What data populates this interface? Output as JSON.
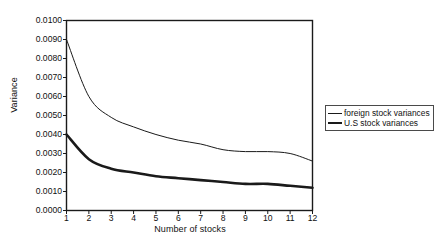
{
  "chart_data": {
    "type": "line",
    "title": "",
    "xlabel": "Number of stocks",
    "ylabel": "Variance",
    "xlim": [
      1,
      12
    ],
    "ylim": [
      0.0,
      0.01
    ],
    "grid": false,
    "legend_position": "right",
    "x": [
      1,
      2,
      3,
      4,
      5,
      6,
      7,
      8,
      9,
      10,
      11,
      12
    ],
    "xticklabels": [
      "1",
      "2",
      "3",
      "4",
      "5",
      "6",
      "7",
      "8",
      "9",
      "10",
      "11",
      "12"
    ],
    "yticks": [
      0.0,
      0.001,
      0.002,
      0.003,
      0.004,
      0.005,
      0.006,
      0.007,
      0.008,
      0.009,
      0.01
    ],
    "yticklabels": [
      "0.0000",
      "0.0010",
      "0.0020",
      "0.0030",
      "0.0040",
      "0.0050",
      "0.0060",
      "0.0070",
      "0.0080",
      "0.0090",
      "0.0100"
    ],
    "series": [
      {
        "name": "foreign stock variances",
        "style": "thin",
        "color": "#1a1a1a",
        "values": [
          0.009,
          0.006,
          0.0049,
          0.0044,
          0.004,
          0.0037,
          0.0035,
          0.0032,
          0.0031,
          0.0031,
          0.003,
          0.0026
        ]
      },
      {
        "name": "U.S stock variances",
        "style": "thick",
        "color": "#1a1a1a",
        "values": [
          0.004,
          0.0027,
          0.0022,
          0.002,
          0.0018,
          0.0017,
          0.0016,
          0.0015,
          0.0014,
          0.0014,
          0.0013,
          0.0012
        ]
      }
    ]
  },
  "legend": {
    "entries": [
      {
        "label": "foreign stock variances"
      },
      {
        "label": "U.S stock variances"
      }
    ]
  }
}
